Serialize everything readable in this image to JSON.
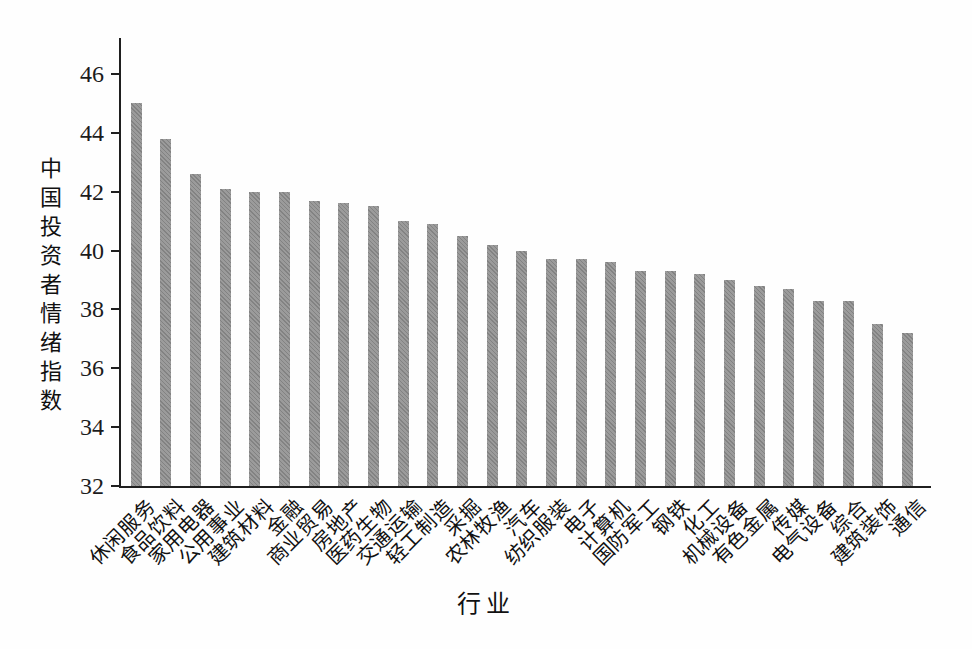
{
  "chart_data": {
    "type": "bar",
    "title": "",
    "xlabel": "行业",
    "ylabel": "中国投资者情绪指数",
    "ylim": [
      32,
      47
    ],
    "yticks": [
      32,
      34,
      36,
      38,
      40,
      42,
      44,
      46
    ],
    "grid": false,
    "legend": "none",
    "bar_color": "#8f8f8f",
    "axis_color": "#1f1f1f",
    "categories": [
      "休闲服务",
      "食品饮料",
      "家用电器",
      "公用事业",
      "建筑材料",
      "金融",
      "商业贸易",
      "房地产",
      "医药生物",
      "交通运输",
      "轻工制造",
      "采掘",
      "农林牧渔",
      "汽车",
      "纺织服装",
      "电子",
      "计算机",
      "国防军工",
      "钢铁",
      "化工",
      "机械设备",
      "有色金属",
      "传媒",
      "电气设备",
      "综合",
      "建筑装饰",
      "通信"
    ],
    "values": [
      45.0,
      43.8,
      42.6,
      42.1,
      42.0,
      42.0,
      41.7,
      41.6,
      41.5,
      41.0,
      40.9,
      40.5,
      40.2,
      40.0,
      39.7,
      39.7,
      39.6,
      39.3,
      39.3,
      39.2,
      39.0,
      38.8,
      38.7,
      38.3,
      38.3,
      37.5,
      37.2
    ]
  }
}
